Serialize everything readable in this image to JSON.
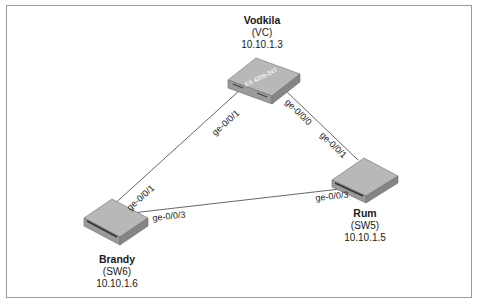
{
  "diagram": {
    "type": "network-topology",
    "nodes": [
      {
        "id": "vodkila",
        "name": "Vodkila",
        "role": "(VC)",
        "ip": "10.10.1.3",
        "device_label": "EX 4200-24T"
      },
      {
        "id": "rum",
        "name": "Rum",
        "role": "(SW5)",
        "ip": "10.10.1.5"
      },
      {
        "id": "brandy",
        "name": "Brandy",
        "role": "(SW6)",
        "ip": "10.10.1.6"
      }
    ],
    "links": [
      {
        "from": "vodkila",
        "from_port": "ge-0/0/1",
        "to": "brandy",
        "to_port": "ge-0/0/1"
      },
      {
        "from": "vodkila",
        "from_port": "ge-0/0/0",
        "to": "rum",
        "to_port": "ge-0/0/1"
      },
      {
        "from": "brandy",
        "from_port": "ge-0/0/3",
        "to": "rum",
        "to_port": "ge-0/0/3"
      }
    ],
    "colors": {
      "switch_top": "#b4b4b4",
      "switch_side": "#8a8a8a",
      "switch_front": "#9c9c9c",
      "link": "#555555",
      "frame": "#9a9a9a"
    }
  }
}
